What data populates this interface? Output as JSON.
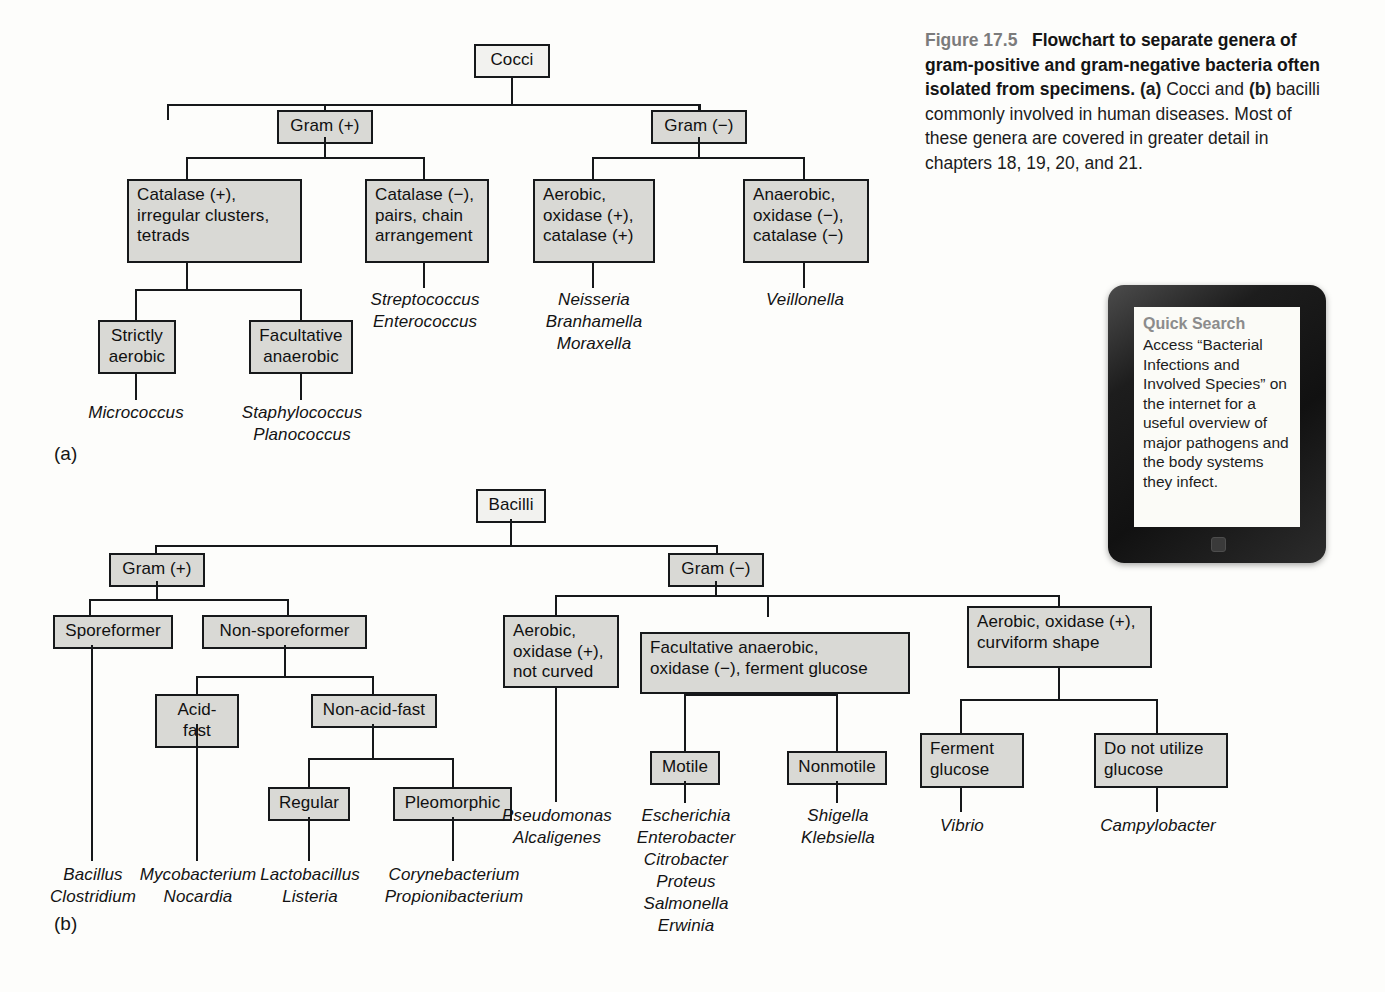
{
  "caption": {
    "figure_label": "Figure 17.5",
    "title": "Flowchart to separate genera of gram-positive and gram-negative bacteria often isolated from specimens.",
    "rest_a": "(a)",
    "rest_b": " Cocci and ",
    "rest_c": "(b)",
    "rest_d": " bacilli commonly involved in human diseases. Most of these genera are covered in greater detail in chapters 18, 19, 20, and 21."
  },
  "tablet": {
    "title": "Quick Search",
    "body": "Access “Bacterial Infections and Involved Species” on the internet for a useful overview of major pathogens and the body systems they infect."
  },
  "panel_a": {
    "label": "(a)",
    "root": "Cocci",
    "gram_pos": "Gram (+)",
    "gram_neg": "Gram (−)",
    "catalase_pos": "Catalase (+),\nirregular clusters,\ntetrads",
    "catalase_neg": "Catalase (−),\npairs, chain\narrangement",
    "aerobic_ox_cat": "Aerobic,\noxidase (+),\ncatalase (+)",
    "anaerobic_ox_cat": "Anaerobic,\noxidase (−),\ncatalase (−)",
    "strictly_aerobic": "Strictly\naerobic",
    "facultative_anaerobic": "Facultative\nanaerobic",
    "genera": {
      "micrococcus": "Micrococcus",
      "staph_plano": "Staphylococcus\nPlanococcus",
      "strep_entero": "Streptococcus\nEnterococcus",
      "neisseria_group": "Neisseria\nBranhamella\nMoraxella",
      "veillonella": "Veillonella"
    }
  },
  "panel_b": {
    "label": "(b)",
    "root": "Bacilli",
    "gram_pos": "Gram (+)",
    "gram_neg": "Gram (−)",
    "sporeformer": "Sporeformer",
    "non_sporeformer": "Non-sporeformer",
    "acid_fast": "Acid-fast",
    "non_acid_fast": "Non-acid-fast",
    "regular": "Regular",
    "pleomorphic": "Pleomorphic",
    "aerobic_not_curved": "Aerobic,\noxidase (+),\nnot curved",
    "facultative_ferment": "Facultative anaerobic,\noxidase (−), ferment glucose",
    "motile": "Motile",
    "nonmotile": "Nonmotile",
    "aerobic_curviform": "Aerobic, oxidase (+),\ncurviform shape",
    "ferment_glucose": "Ferment\nglucose",
    "do_not_utilize_glucose": "Do not utilize\nglucose",
    "genera": {
      "bacillus_clostridium": "Bacillus\nClostridium",
      "myco_nocardia": "Mycobacterium\nNocardia",
      "lacto_listeria": "Lactobacillus\nListeria",
      "coryne_propioni": "Corynebacterium\nPropionibacterium",
      "pseudomonas_alcaligenes": "Pseudomonas\nAlcaligenes",
      "enterics": "Escherichia\nEnterobacter\nCitrobacter\nProteus\nSalmonella\nErwinia",
      "shigella_klebsiella": "Shigella\nKlebsiella",
      "vibrio": "Vibrio",
      "campylobacter": "Campylobacter"
    }
  }
}
